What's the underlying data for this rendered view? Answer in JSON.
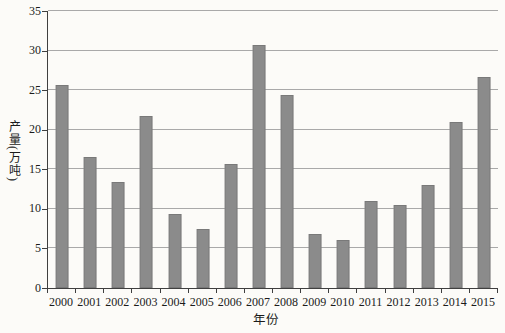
{
  "figure": {
    "background_color": "#fcfbf8"
  },
  "chart_data": {
    "type": "bar",
    "title": "",
    "xlabel": "年份",
    "ylabel": "产量(万吨)",
    "categories": [
      "2000",
      "2001",
      "2002",
      "2003",
      "2004",
      "2005",
      "2006",
      "2007",
      "2008",
      "2009",
      "2010",
      "2011",
      "2012",
      "2013",
      "2014",
      "2015"
    ],
    "values": [
      25.7,
      16.5,
      13.4,
      21.7,
      9.4,
      7.5,
      15.7,
      30.7,
      24.4,
      6.8,
      6.1,
      11.0,
      10.5,
      13.0,
      21.0,
      26.7
    ],
    "ylim": [
      0,
      35
    ],
    "yticks": [
      0,
      5,
      10,
      15,
      20,
      25,
      30,
      35
    ],
    "grid": "horizontal",
    "legend": "none",
    "bar_color": "#8b8b8b",
    "gridline_color": "#a9a9a9",
    "axis_color": "#3f3f3f",
    "text_color": "#1b1b1b"
  }
}
